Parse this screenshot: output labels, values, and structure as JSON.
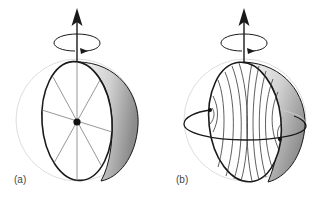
{
  "panels": [
    {
      "id": "a",
      "label": "(a)",
      "description": "rotating sphere cut by a meridian disk with radial spokes and center dot"
    },
    {
      "id": "b",
      "label": "(b)",
      "description": "rotating sphere cut by a meridian disk with curved field lines and an equatorial loop"
    }
  ],
  "colors": {
    "stroke": "#1a1a1a",
    "sphere_outline": "#d8d8d8",
    "shade_light": "#f4f4f4",
    "shade_dark": "#8a8a8a",
    "spoke": "#777777"
  }
}
